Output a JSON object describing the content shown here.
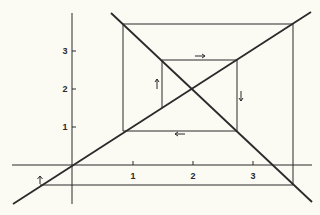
{
  "diagram": {
    "title": "",
    "colors": {
      "ink": "#2a2a2a",
      "background": "#fbfaf3"
    },
    "x_axis": {
      "ticks": [
        "1",
        "2",
        "3"
      ]
    },
    "y_axis": {
      "ticks": [
        "1",
        "2",
        "3"
      ]
    },
    "arrows": [
      {
        "direction": "right",
        "glyph": "→"
      },
      {
        "direction": "down",
        "glyph": "↓"
      },
      {
        "direction": "left",
        "glyph": "←"
      },
      {
        "direction": "up",
        "glyph": "↑"
      },
      {
        "direction": "up",
        "glyph": "↑"
      }
    ]
  }
}
